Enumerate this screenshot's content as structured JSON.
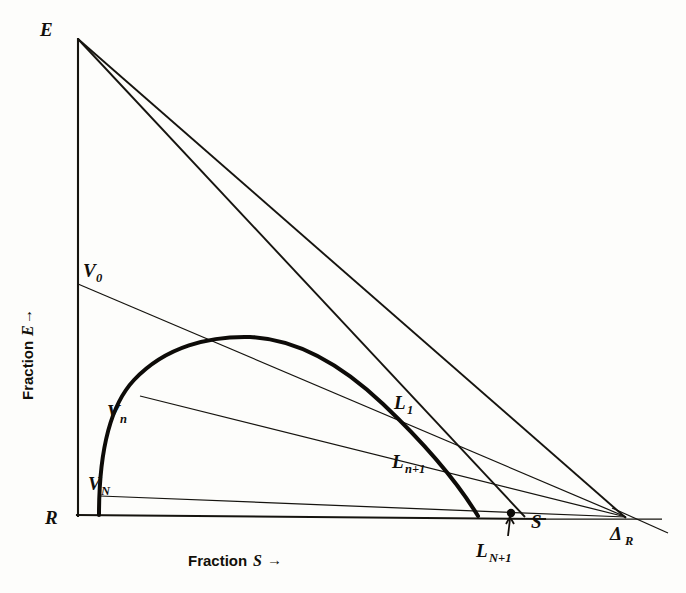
{
  "figure": {
    "type": "ternary-extraction-stage-diagram",
    "background_color": "#fdfdfb",
    "ink_color": "#16140f",
    "axes": {
      "y_axis_title": "Fraction",
      "y_axis_variable": "E",
      "y_axis_arrow": "→",
      "x_axis_title": "Fraction",
      "x_axis_variable": "S",
      "x_axis_arrow": "→"
    },
    "vertices": {
      "top_left": "E",
      "bottom_left": "R",
      "difference_point": "Δ",
      "difference_point_sub": "R"
    },
    "curve_points": [
      {
        "id": "V0",
        "label": "V",
        "sub": "0",
        "x": 78,
        "y": 284
      },
      {
        "id": "Vn",
        "label": "V",
        "sub": "n",
        "x": 140,
        "y": 396
      },
      {
        "id": "VN",
        "label": "V",
        "sub": "N",
        "x": 100,
        "y": 496
      },
      {
        "id": "L1",
        "label": "L",
        "sub": "1",
        "x": 393,
        "y": 402
      },
      {
        "id": "Ln1",
        "label": "L",
        "sub": "n+1",
        "x": 430,
        "y": 462
      },
      {
        "id": "LN1",
        "label": "L",
        "sub": "N+1",
        "x": 511,
        "y": 514
      },
      {
        "id": "S",
        "label": "S",
        "sub": "",
        "x": 524,
        "y": 516
      }
    ],
    "labels": {
      "E": "E",
      "R": "R",
      "S": "S",
      "delta": "Δ",
      "delta_sub": "R",
      "V0": "V",
      "V0_sub": "0",
      "Vn": "V",
      "Vn_sub": "n",
      "VN": "V",
      "VN_sub": "N",
      "L1": "L",
      "L1_sub": "1",
      "Ln1": "L",
      "Ln1_sub": "n+1",
      "LN1": "L",
      "LN1_sub": "N+1"
    },
    "bleed_through_lines": [
      "                     ",
      "                     ",
      "                     ",
      "                     ",
      "                     ",
      "                     "
    ]
  },
  "chart_data": {
    "type": "line",
    "title": "",
    "xlabel": "Fraction S →",
    "ylabel": "Fraction E →",
    "xlim": [
      0,
      1
    ],
    "ylim": [
      0,
      1
    ],
    "grid": false,
    "legend": "none",
    "annotations": [
      "E",
      "R",
      "S",
      "ΔR",
      "V0",
      "Vn",
      "VN",
      "L1",
      "Ln+1",
      "LN+1"
    ],
    "series": [
      {
        "name": "binodal-curve",
        "style": "thick-solid",
        "points": [
          [
            99,
            515
          ],
          [
            104,
            470
          ],
          [
            112,
            432
          ],
          [
            126,
            400
          ],
          [
            146,
            374
          ],
          [
            172,
            354
          ],
          [
            205,
            341
          ],
          [
            248,
            337
          ],
          [
            292,
            345
          ],
          [
            334,
            363
          ],
          [
            372,
            388
          ],
          [
            404,
            416
          ],
          [
            432,
            447
          ],
          [
            455,
            478
          ],
          [
            470,
            500
          ],
          [
            478,
            516
          ]
        ]
      },
      {
        "name": "E-to-delta-R-operating-line",
        "style": "solid",
        "points": [
          [
            78,
            39
          ],
          [
            625,
            517
          ]
        ]
      },
      {
        "name": "E-to-S-operating-line",
        "style": "solid",
        "points": [
          [
            78,
            39
          ],
          [
            524,
            516
          ]
        ]
      },
      {
        "name": "V0-tie-line",
        "style": "thin-solid",
        "points": [
          [
            78,
            284
          ],
          [
            625,
            517
          ]
        ]
      },
      {
        "name": "Vn-tie-line",
        "style": "thin-solid",
        "points": [
          [
            140,
            396
          ],
          [
            625,
            517
          ]
        ]
      },
      {
        "name": "VN-tie-line",
        "style": "thin-solid",
        "points": [
          [
            100,
            496
          ],
          [
            625,
            517
          ]
        ]
      },
      {
        "name": "delta-R-extension",
        "style": "thin-solid",
        "points": [
          [
            78,
            515
          ],
          [
            660,
            528
          ]
        ]
      }
    ],
    "markers": [
      {
        "name": "LN+1-point",
        "x": 511,
        "y": 514
      }
    ]
  }
}
